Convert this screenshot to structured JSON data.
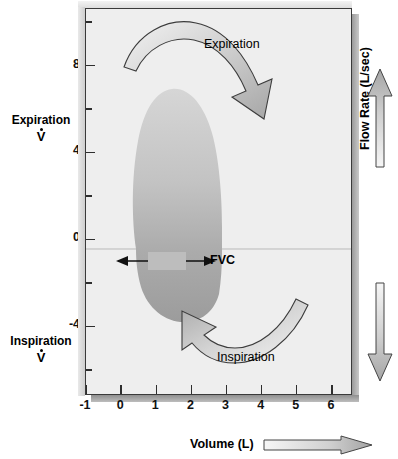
{
  "figure": {
    "kind": "flow-volume-loop",
    "background": "#ffffff",
    "plot_background": "#eeeeee",
    "loop_fill_top": "#cfcfcf",
    "loop_fill_bottom": "#a0a0a0",
    "arrow_fill": "#c0c0c0",
    "axis_color": "#2e2e2e"
  },
  "axes": {
    "x": {
      "label": "Volume (L)",
      "ticks": [
        "-1",
        "0",
        "1",
        "2",
        "3",
        "4",
        "5",
        "6"
      ],
      "values": [
        -1,
        0,
        1,
        2,
        3,
        4,
        5,
        6
      ],
      "min": -1,
      "max": 6.6
    },
    "y": {
      "label": "Flow Rate (L/sec)",
      "ticks": [
        "8",
        "4",
        "0",
        "-4"
      ],
      "values": [
        8,
        4,
        0,
        -4
      ],
      "minor_values": [
        10,
        6,
        2,
        -2,
        -6
      ],
      "min": -7.2,
      "max": 10.6
    }
  },
  "labels": {
    "expiration_axis": "Expiration",
    "inspiration_axis": "Inspiration",
    "v_dot": "V",
    "expiration_arrow": "Expiration",
    "inspiration_arrow": "Inspiration",
    "fvc": "FVC"
  },
  "chart_data": {
    "type": "line",
    "title": "",
    "xlabel": "Volume (L)",
    "ylabel": "Flow Rate (L/sec)",
    "xlim": [
      -1,
      6.6
    ],
    "ylim": [
      -7.2,
      10.6
    ],
    "grid": false,
    "legend": null,
    "annotations": [
      {
        "text": "Expiration",
        "role": "upper-quadrant-direction"
      },
      {
        "text": "Inspiration",
        "role": "lower-quadrant-direction"
      },
      {
        "text": "FVC",
        "role": "forced-vital-capacity-span",
        "x_start": 0.55,
        "x_end": 2.3,
        "y": -0.35
      }
    ],
    "series": [
      {
        "name": "Expiratory limb",
        "points": [
          {
            "volume": 0.5,
            "flow": 0.0
          },
          {
            "volume": 0.72,
            "flow": 4.2
          },
          {
            "volume": 1.05,
            "flow": 7.4
          },
          {
            "volume": 1.45,
            "flow": 8.5
          },
          {
            "volume": 1.85,
            "flow": 7.8
          },
          {
            "volume": 2.15,
            "flow": 5.6
          },
          {
            "volume": 2.32,
            "flow": 2.6
          },
          {
            "volume": 2.35,
            "flow": 0.0
          }
        ]
      },
      {
        "name": "Inspiratory limb",
        "points": [
          {
            "volume": 2.35,
            "flow": 0.0
          },
          {
            "volume": 2.3,
            "flow": -1.6
          },
          {
            "volume": 2.05,
            "flow": -3.4
          },
          {
            "volume": 1.7,
            "flow": -4.4
          },
          {
            "volume": 1.2,
            "flow": -4.5
          },
          {
            "volume": 0.8,
            "flow": -3.4
          },
          {
            "volume": 0.55,
            "flow": -1.5
          },
          {
            "volume": 0.5,
            "flow": 0.0
          }
        ]
      }
    ],
    "measures": [
      {
        "name": "FVC",
        "value": 1.8,
        "unit": "L"
      },
      {
        "name": "Peak expiratory flow",
        "value": 8.5,
        "unit": "L/sec"
      },
      {
        "name": "Peak inspiratory flow",
        "value": -4.5,
        "unit": "L/sec"
      }
    ]
  }
}
